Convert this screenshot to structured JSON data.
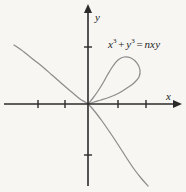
{
  "figure": {
    "name": "folium-of-descartes",
    "background_color": "#f7f6f3",
    "curve_color": "#8d8d8d",
    "axis_color": "#2b2b2b",
    "text_color": "#1c1c1c"
  },
  "equation": {
    "full": "x3 + y3 = nxy",
    "lhs_base1": "x",
    "lhs_exp1": "3",
    "plus": "+",
    "lhs_base2": "y",
    "lhs_exp2": "3",
    "equals": "=",
    "rhs": "nxy"
  },
  "axes": {
    "x_label": "x",
    "y_label": "y",
    "origin": {
      "x": 88,
      "y": 104
    },
    "x_axis": {
      "start_x": 4,
      "end_x": 176,
      "y": 104,
      "arrow": "right"
    },
    "y_axis": {
      "x": 88,
      "start_y": 186,
      "end_y": 10,
      "arrow": "up"
    },
    "x_ticks": [
      38,
      65,
      118,
      146
    ],
    "y_ticks": [
      47,
      155
    ],
    "tick_half_length": 4
  },
  "chart_data": {
    "type": "line",
    "title": "",
    "xlabel": "x",
    "ylabel": "y",
    "grid": false,
    "legend": null,
    "annotations": [
      {
        "text": "x3 + y3 = nxy",
        "x": 108,
        "y": 38
      }
    ],
    "series": [
      {
        "name": "asymptotic-branch",
        "comment": "upper-left to lower-right branch of the folium, passing through the origin",
        "points": [
          [
            14,
            45
          ],
          [
            24,
            52
          ],
          [
            34,
            60
          ],
          [
            44,
            68
          ],
          [
            52,
            75
          ],
          [
            60,
            82
          ],
          [
            68,
            89
          ],
          [
            74,
            94
          ],
          [
            80,
            99
          ],
          [
            85,
            102
          ],
          [
            88,
            104
          ],
          [
            91,
            107
          ],
          [
            96,
            113
          ],
          [
            102,
            121
          ],
          [
            109,
            131
          ],
          [
            117,
            143
          ],
          [
            126,
            157
          ],
          [
            134,
            169
          ],
          [
            141,
            178
          ],
          [
            148,
            186
          ]
        ]
      },
      {
        "name": "loop",
        "comment": "closed loop in the first quadrant starting and ending at the origin",
        "points": [
          [
            88,
            104
          ],
          [
            93,
            98
          ],
          [
            98,
            91
          ],
          [
            103,
            83
          ],
          [
            108,
            74
          ],
          [
            113,
            66
          ],
          [
            118,
            60
          ],
          [
            124,
            57
          ],
          [
            131,
            58
          ],
          [
            137,
            63
          ],
          [
            140,
            70
          ],
          [
            139,
            77
          ],
          [
            134,
            83
          ],
          [
            127,
            88
          ],
          [
            119,
            93
          ],
          [
            110,
            97
          ],
          [
            101,
            100
          ],
          [
            94,
            102
          ],
          [
            88,
            104
          ]
        ]
      }
    ]
  }
}
